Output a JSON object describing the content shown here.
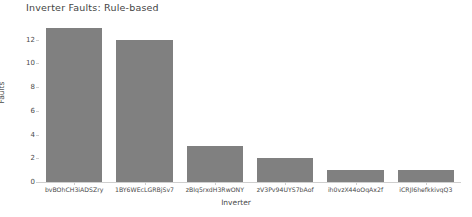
{
  "chart_data": {
    "type": "bar",
    "title": "Inverter Faults: Rule-based",
    "xlabel": "Inverter",
    "ylabel": "Faults",
    "categories": [
      "bvBOhCH3iADSZry",
      "1BY6WEcLGRBjSv7",
      "zBIq5rxdH3RwONY",
      "zV3Pv94UYS7bAof",
      "ih0vzX44oOqAx2f",
      "iCRJl6hefkkivqQ3"
    ],
    "values": [
      13,
      12,
      3,
      2,
      1,
      1
    ],
    "ylim": [
      0,
      13.65
    ],
    "yticks": [
      0,
      2,
      4,
      6,
      8,
      10,
      12
    ],
    "ytick_labels": [
      "0",
      "2",
      "4",
      "6",
      "8",
      "10",
      "12"
    ],
    "grid": false,
    "legend": null,
    "bar_color": "#808080",
    "background_color": "#ffffff",
    "axis_color": "#cfcfcf",
    "text_color": "#4a4a4a"
  }
}
